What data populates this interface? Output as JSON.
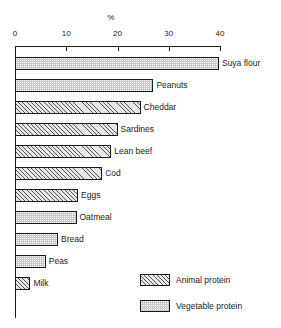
{
  "chart_data": {
    "type": "bar",
    "orientation": "horizontal",
    "title": "",
    "xlabel": "%",
    "ylabel": "",
    "xlim": [
      0,
      40
    ],
    "xticks": [
      0,
      10,
      20,
      30,
      40
    ],
    "xtick_labels": [
      "0",
      "10",
      "20",
      "30",
      "40"
    ],
    "grid": false,
    "legend_position": "bottom-right",
    "categories": [
      "Suya flour",
      "Peanuts",
      "Cheddar",
      "Sardines",
      "Lean beef",
      "Cod",
      "Eggs",
      "Oatmeal",
      "Bread",
      "Peas",
      "Milk"
    ],
    "values": [
      39.8,
      27.0,
      24.5,
      20.0,
      18.8,
      17.0,
      12.3,
      12.0,
      8.4,
      6.0,
      3.0
    ],
    "groups": [
      "vegetable",
      "vegetable",
      "animal",
      "animal",
      "animal",
      "animal",
      "animal",
      "vegetable",
      "vegetable",
      "vegetable",
      "animal"
    ],
    "bars": [
      {
        "label": "Suya flour",
        "value": 39.8,
        "group": "vegetable"
      },
      {
        "label": "Peanuts",
        "value": 27.0,
        "group": "vegetable"
      },
      {
        "label": "Cheddar",
        "value": 24.5,
        "group": "animal"
      },
      {
        "label": "Sardines",
        "value": 20.0,
        "group": "animal"
      },
      {
        "label": "Lean beef",
        "value": 18.8,
        "group": "animal"
      },
      {
        "label": "Cod",
        "value": 17.0,
        "group": "animal"
      },
      {
        "label": "Eggs",
        "value": 12.3,
        "group": "animal"
      },
      {
        "label": "Oatmeal",
        "value": 12.0,
        "group": "vegetable"
      },
      {
        "label": "Bread",
        "value": 8.4,
        "group": "vegetable"
      },
      {
        "label": "Peas",
        "value": 6.0,
        "group": "vegetable"
      },
      {
        "label": "Milk",
        "value": 3.0,
        "group": "animal"
      }
    ],
    "legend": [
      {
        "key": "animal",
        "label": "Animal protein"
      },
      {
        "key": "vegetable",
        "label": "Vegetable protein"
      }
    ],
    "colors": {
      "animal_fill": "#e8e8e8",
      "animal_hatch": "#555555",
      "vegetable_fill": "#c9c9c9",
      "outline": "#1a1a1a",
      "background": "#ffffff"
    }
  }
}
